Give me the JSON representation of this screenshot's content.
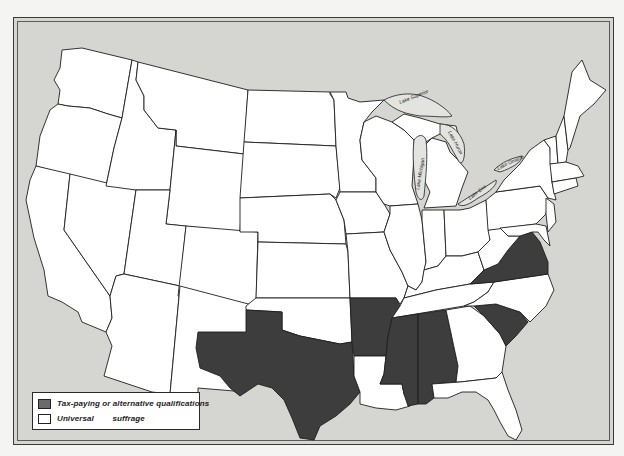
{
  "map": {
    "type": "choropleth",
    "region": "United States",
    "categories": {
      "tax": {
        "label": "Tax-paying or alternative qualifications",
        "color": "#3d3d3d"
      },
      "universal": {
        "label": "Universal        suffrage",
        "color": "#ffffff"
      }
    },
    "states_tax": [
      "Texas",
      "Arkansas",
      "Mississippi",
      "Alabama",
      "Virginia",
      "South Carolina"
    ],
    "lakes": [
      "Lake Superior",
      "Lake Michigan",
      "Lake Huron",
      "Lake Erie",
      "Lake Ontario"
    ]
  },
  "legend": {
    "items": [
      {
        "key": "tax",
        "label": "Tax-paying or alternative qualifications"
      },
      {
        "key": "universal",
        "label": "Universal        suffrage"
      }
    ]
  },
  "lake_labels": {
    "superior": "Lake Superior",
    "michigan": "Lake Michigan",
    "huron": "Lake Huron",
    "erie": "Lake Erie",
    "ontario": "Lake Ontario"
  },
  "colors": {
    "background": "#e3e3e0",
    "land": "#ffffff",
    "shaded": "#3d3d3d",
    "border": "#1e1e1e"
  }
}
